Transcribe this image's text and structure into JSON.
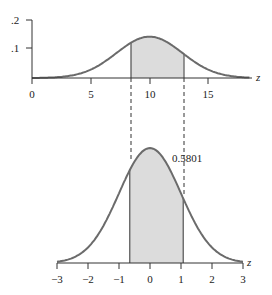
{
  "chart_data": [
    {
      "type": "area",
      "title": "",
      "xlabel": "z",
      "ylabel": "",
      "distribution": "normal",
      "mean": 10,
      "sd": 2.8,
      "xlim": [
        0,
        19
      ],
      "ylim": [
        0,
        0.2
      ],
      "x_ticks": [
        0,
        5,
        10,
        15
      ],
      "x_tick_labels": [
        "0",
        "5",
        "10",
        "15"
      ],
      "y_ticks": [
        0.1,
        0.2
      ],
      "y_tick_labels": [
        ".1",
        ".2"
      ],
      "shaded_interval": [
        8.4,
        12.9
      ],
      "grid": false
    },
    {
      "type": "area",
      "title": "",
      "xlabel": "z",
      "ylabel": "",
      "distribution": "standard normal",
      "mean": 0,
      "sd": 1,
      "xlim": [
        -3,
        3
      ],
      "x_ticks": [
        -3,
        -2,
        -1,
        0,
        1,
        2,
        3
      ],
      "x_tick_labels": [
        "−3",
        "−2",
        "−1",
        "0",
        "1",
        "2",
        "3"
      ],
      "shaded_interval": [
        -0.65,
        1.07
      ],
      "annotation": "0.5801",
      "grid": false
    }
  ],
  "top": {
    "axis_label": "z",
    "y_labels": [
      ".2",
      ".1"
    ],
    "x_labels": [
      "0",
      "5",
      "10",
      "15"
    ]
  },
  "bottom": {
    "axis_label": "z",
    "area_label": "0.5801",
    "x_labels": [
      "−3",
      "−2",
      "−1",
      "0",
      "1",
      "2",
      "3"
    ]
  },
  "colors": {
    "curve": "#6b6b6b",
    "shade": "#dcdcdc",
    "axis": "#333333"
  }
}
